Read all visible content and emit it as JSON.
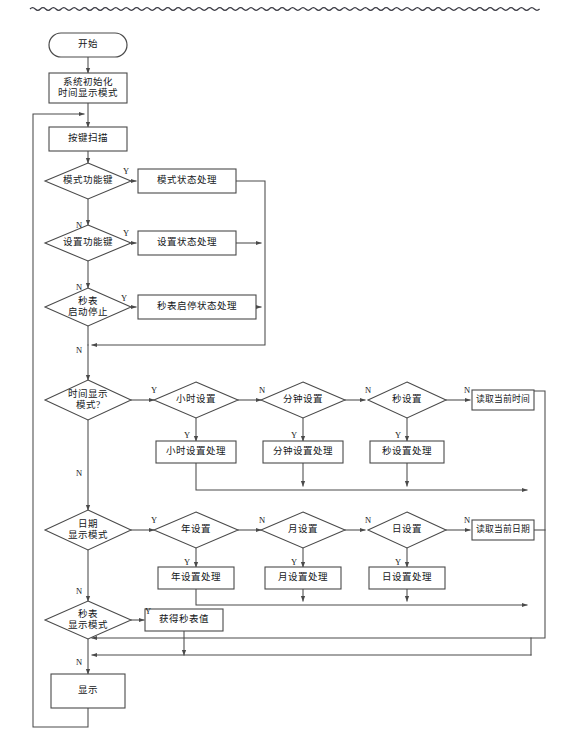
{
  "page": {
    "width": 565,
    "height": 753,
    "background": "#ffffff",
    "line_color": "#4a4a4a",
    "text_color": "#15171a",
    "decoration": {
      "top_rule": "wavy-line",
      "top_rule_color": "#3b3b44"
    }
  },
  "nodes": {
    "start": {
      "label": "开始",
      "type": "terminator",
      "x": 88,
      "y": 45,
      "w": 78,
      "h": 24
    },
    "init": {
      "label": "系统初始化\n时间显示模式",
      "type": "process",
      "x": 88,
      "y": 88,
      "w": 78,
      "h": 30
    },
    "keyscan": {
      "label": "按键扫描",
      "type": "process",
      "x": 88,
      "y": 139,
      "w": 78,
      "h": 24
    },
    "d_mode_key": {
      "label": "模式功能键",
      "type": "decision",
      "x": 88,
      "y": 181,
      "w": 86,
      "h": 36
    },
    "p_mode_state": {
      "label": "模式状态处理",
      "type": "process",
      "x": 187,
      "y": 181,
      "w": 98,
      "h": 24
    },
    "d_set_key": {
      "label": "设置功能键",
      "type": "decision",
      "x": 88,
      "y": 243,
      "w": 86,
      "h": 36
    },
    "p_set_state": {
      "label": "设置状态处理",
      "type": "process",
      "x": 187,
      "y": 243,
      "w": 98,
      "h": 24
    },
    "d_sw_key": {
      "label": "秒表\n启动停止",
      "type": "decision",
      "x": 88,
      "y": 307,
      "w": 86,
      "h": 38
    },
    "p_sw_state": {
      "label": "秒表启停状态处理",
      "type": "process",
      "x": 197,
      "y": 307,
      "w": 118,
      "h": 24
    },
    "d_time_mode": {
      "label": "时间显示\n模式?",
      "type": "decision",
      "x": 88,
      "y": 400,
      "w": 86,
      "h": 40
    },
    "d_hour": {
      "label": "小时设置",
      "type": "decision",
      "x": 196,
      "y": 400,
      "w": 84,
      "h": 36
    },
    "d_min": {
      "label": "分钟设置",
      "type": "decision",
      "x": 303,
      "y": 400,
      "w": 84,
      "h": 36
    },
    "d_sec": {
      "label": "秒设置",
      "type": "decision",
      "x": 407,
      "y": 400,
      "w": 78,
      "h": 36
    },
    "p_read_time": {
      "label": "读取当前时间",
      "type": "process",
      "x": 503,
      "y": 400,
      "w": 62,
      "h": 20
    },
    "p_hour_proc": {
      "label": "小时设置处理",
      "type": "process",
      "x": 196,
      "y": 452,
      "w": 80,
      "h": 22
    },
    "p_min_proc": {
      "label": "分钟设置处理",
      "type": "process",
      "x": 303,
      "y": 452,
      "w": 80,
      "h": 22
    },
    "p_sec_proc": {
      "label": "秒设置处理",
      "type": "process",
      "x": 407,
      "y": 452,
      "w": 74,
      "h": 22
    },
    "d_date_mode": {
      "label": "日期\n显示模式",
      "type": "decision",
      "x": 88,
      "y": 530,
      "w": 86,
      "h": 40
    },
    "d_year": {
      "label": "年设置",
      "type": "decision",
      "x": 196,
      "y": 530,
      "w": 84,
      "h": 36
    },
    "d_month": {
      "label": "月设置",
      "type": "decision",
      "x": 303,
      "y": 530,
      "w": 84,
      "h": 36
    },
    "d_day": {
      "label": "日设置",
      "type": "decision",
      "x": 407,
      "y": 530,
      "w": 78,
      "h": 36
    },
    "p_read_date": {
      "label": "读取当前日期",
      "type": "process",
      "x": 503,
      "y": 530,
      "w": 62,
      "h": 20
    },
    "p_year_proc": {
      "label": "年设置处理",
      "type": "process",
      "x": 196,
      "y": 578,
      "w": 76,
      "h": 22
    },
    "p_month_proc": {
      "label": "月设置处理",
      "type": "process",
      "x": 303,
      "y": 578,
      "w": 76,
      "h": 22
    },
    "p_day_proc": {
      "label": "日设置处理",
      "type": "process",
      "x": 407,
      "y": 578,
      "w": 76,
      "h": 22
    },
    "d_sw_mode": {
      "label": "秒表\n显示模式",
      "type": "decision",
      "x": 88,
      "y": 620,
      "w": 86,
      "h": 38
    },
    "p_get_sw": {
      "label": "获得秒表值",
      "type": "process",
      "x": 184,
      "y": 620,
      "w": 78,
      "h": 22
    },
    "display": {
      "label": "显示",
      "type": "process",
      "x": 88,
      "y": 691,
      "w": 74,
      "h": 34
    }
  },
  "edge_labels": {
    "yes": "Y",
    "no": "N"
  },
  "branch_markers": [
    {
      "name": "mode-key-yes",
      "text": "Y",
      "x": 126,
      "y": 172
    },
    {
      "name": "mode-key-no",
      "text": "N",
      "x": 79,
      "y": 226
    },
    {
      "name": "set-key-yes",
      "text": "Y",
      "x": 126,
      "y": 234
    },
    {
      "name": "set-key-no",
      "text": "N",
      "x": 79,
      "y": 288
    },
    {
      "name": "stopwatch-key-yes",
      "text": "Y",
      "x": 124,
      "y": 299
    },
    {
      "name": "stopwatch-key-no",
      "text": "N",
      "x": 79,
      "y": 351
    },
    {
      "name": "time-mode-yes",
      "text": "Y",
      "x": 154,
      "y": 391
    },
    {
      "name": "time-mode-no",
      "text": "N",
      "x": 79,
      "y": 474
    },
    {
      "name": "hour-no",
      "text": "N",
      "x": 262,
      "y": 391
    },
    {
      "name": "hour-yes",
      "text": "Y",
      "x": 187,
      "y": 436
    },
    {
      "name": "min-no",
      "text": "N",
      "x": 368,
      "y": 391
    },
    {
      "name": "min-yes",
      "text": "Y",
      "x": 294,
      "y": 436
    },
    {
      "name": "sec-no",
      "text": "N",
      "x": 467,
      "y": 391
    },
    {
      "name": "sec-yes",
      "text": "Y",
      "x": 398,
      "y": 436
    },
    {
      "name": "date-mode-yes",
      "text": "Y",
      "x": 154,
      "y": 521
    },
    {
      "name": "date-mode-no",
      "text": "N",
      "x": 79,
      "y": 592
    },
    {
      "name": "year-no",
      "text": "N",
      "x": 262,
      "y": 521
    },
    {
      "name": "year-yes",
      "text": "Y",
      "x": 187,
      "y": 563
    },
    {
      "name": "month-no",
      "text": "N",
      "x": 368,
      "y": 521
    },
    {
      "name": "month-yes",
      "text": "Y",
      "x": 294,
      "y": 563
    },
    {
      "name": "day-no",
      "text": "N",
      "x": 467,
      "y": 521
    },
    {
      "name": "day-yes",
      "text": "Y",
      "x": 398,
      "y": 563
    },
    {
      "name": "sw-mode-yes",
      "text": "Y",
      "x": 148,
      "y": 612
    },
    {
      "name": "sw-mode-no",
      "text": "N",
      "x": 79,
      "y": 663
    }
  ]
}
